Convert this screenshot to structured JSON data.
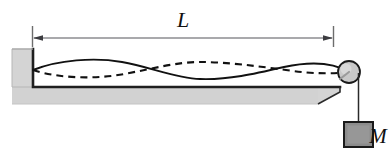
{
  "figure": {
    "kind": "physics-diagram",
    "width": 391,
    "height": 151,
    "background_color": "#ffffff"
  },
  "labels": {
    "length_label": "L",
    "mass_label": "M"
  },
  "colors": {
    "stroke": "#1a1a1a",
    "table_fill": "#d4d4d4",
    "table_edge": "#9a9a9a",
    "pulley_fill": "#c9c9c9",
    "mass_fill": "#8c8c8c",
    "mass_edge": "#1a1a1a",
    "dimension_line": "#5a5a5a",
    "background": "#ffffff"
  },
  "geometry": {
    "dimension_line": {
      "y": 38,
      "x_start": 32,
      "x_end": 333,
      "tick_top": 26,
      "tick_bottom": 47,
      "label_x": 183,
      "label_y": 20
    },
    "table": {
      "wall_left_x": 12,
      "wall_right_x": 33,
      "wall_top_y": 49,
      "top_surface_y": 87,
      "top_surface_right_x": 340,
      "base_bottom_y": 104,
      "base_right_x": 318
    },
    "string": {
      "anchor_x": 33,
      "anchor_y": 70,
      "equilibrium_y": 70,
      "pulley_contact_x": 349,
      "vertical_x": 358,
      "vertical_bottom_y": 122
    },
    "pulley": {
      "center_x": 349,
      "center_y": 72,
      "radius": 11,
      "spoke_angle_deg": 215
    },
    "mass_block": {
      "x": 340,
      "y": 122,
      "width": 30,
      "height": 25
    },
    "wave": {
      "axis_y": 70,
      "amplitude": 9,
      "half_wavelengths": 2,
      "solid_phase": "positive",
      "dashed_phase": "negative",
      "dash_pattern": "7,5"
    }
  }
}
